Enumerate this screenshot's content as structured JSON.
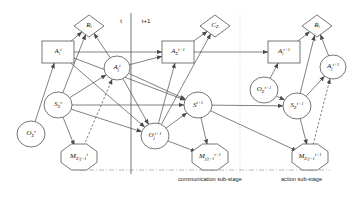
{
  "diagram": {
    "canvas": {
      "width": 363,
      "height": 198
    },
    "colors": {
      "stroke": "#4a4a4a",
      "node_fill": "#ffffff",
      "text": "#111111",
      "divider_solid": "#666666",
      "divider_dotted": "#bbbbbb",
      "bottom_dashdot": "#999999"
    },
    "time_markers": [
      {
        "name": "time-marker-t",
        "text": "t",
        "x": 121,
        "y": 21
      },
      {
        "name": "time-marker-t-plus-1",
        "text": "t+1",
        "x": 146,
        "y": 21
      }
    ],
    "stage_captions": [
      {
        "name": "communication-sub-stage-caption",
        "text": "communication sub-stage",
        "x": 178,
        "y": 176
      },
      {
        "name": "action-sub-stage-caption",
        "text": "action sub-stage",
        "x": 281,
        "y": 176
      }
    ],
    "nodes": [
      {
        "id": "R_i_left",
        "name": "decision-node-R-i-left",
        "shape": "diamond",
        "cx": 89,
        "cy": 26,
        "w": 30,
        "h": 22,
        "html": "R<sub>i</sub>"
      },
      {
        "id": "A_i_t",
        "name": "state-node-A-i-t",
        "shape": "rectangle",
        "cx": 58,
        "cy": 52,
        "w": 32,
        "h": 22,
        "html": "A<sub>i</sub><sup>t</sup>"
      },
      {
        "id": "A_j_t",
        "name": "state-node-A-j-t",
        "shape": "circle",
        "cx": 117,
        "cy": 68,
        "w": 26,
        "h": 24,
        "html": "A<sub>j</sub><sup>t</sup>"
      },
      {
        "id": "S_sigma_t",
        "name": "state-node-S-sigma-t",
        "shape": "circle",
        "cx": 58,
        "cy": 105,
        "w": 28,
        "h": 26,
        "html": "S<sub>&#931;</sub><sup>t</sup>"
      },
      {
        "id": "O_sigma_t",
        "name": "observation-node-O-sigma-t",
        "shape": "circle",
        "cx": 31,
        "cy": 134,
        "w": 28,
        "h": 26,
        "html": "O<sub>&#931;</sub><sup>t</sup>"
      },
      {
        "id": "M_sigma_t",
        "name": "message-node-M-sigma-j1-t",
        "shape": "hexagon",
        "cx": 79,
        "cy": 157,
        "w": 36,
        "h": 26,
        "html": "M<sub>&#931;/j&minus;1</sub><sup>t</sup>"
      },
      {
        "id": "C_sigma",
        "name": "utility-node-C-sigma",
        "shape": "diamond",
        "cx": 215,
        "cy": 26,
        "w": 30,
        "h": 22,
        "html": "C<sub>&#931;</sub>"
      },
      {
        "id": "A_sigma_t1",
        "name": "state-node-A-sigma-t-plus-1",
        "shape": "rectangle",
        "cx": 178,
        "cy": 52,
        "w": 32,
        "h": 22,
        "html": "A<sub>&#931;</sub><sup>t+1</sup>"
      },
      {
        "id": "S_t1",
        "name": "state-node-S-t-plus-1",
        "shape": "circle",
        "cx": 198,
        "cy": 105,
        "w": 28,
        "h": 26,
        "html": "S<sup>t+1</sup>"
      },
      {
        "id": "O_j_t1",
        "name": "observation-node-O-j-t-plus-1",
        "shape": "circle",
        "cx": 155,
        "cy": 136,
        "w": 28,
        "h": 26,
        "html": "O<sub>j</sub><sup>t+1</sup>"
      },
      {
        "id": "M_j_t1",
        "name": "message-node-M-j-j1-t-plus-1",
        "shape": "hexagon",
        "cx": 210,
        "cy": 157,
        "w": 36,
        "h": 26,
        "html": "M<sub>j/j&minus;1</sub><sup>t+1</sup>"
      },
      {
        "id": "O_sigma_t1",
        "name": "observation-node-O-sigma-t-plus-1",
        "shape": "circle",
        "cx": 264,
        "cy": 90,
        "w": 28,
        "h": 26,
        "html": "O<sub>&#931;</sub><sup>t+1</sup>"
      },
      {
        "id": "S_sigma_t1",
        "name": "state-node-S-sigma-t-plus-1",
        "shape": "circle",
        "cx": 297,
        "cy": 106,
        "w": 28,
        "h": 26,
        "html": "S<sub>&#931;</sub><sup>t+1</sup>"
      },
      {
        "id": "A_i_t1",
        "name": "state-node-A-i-t-plus-1",
        "shape": "rectangle",
        "cx": 284,
        "cy": 52,
        "w": 32,
        "h": 22,
        "html": "A<sub>i</sub><sup>t+1</sup>"
      },
      {
        "id": "R_i_right",
        "name": "decision-node-R-i-right",
        "shape": "diamond",
        "cx": 317,
        "cy": 26,
        "w": 30,
        "h": 22,
        "html": "R<sub>i</sub>"
      },
      {
        "id": "A_j_t1",
        "name": "state-node-A-j-t-plus-1",
        "shape": "circle",
        "cx": 333,
        "cy": 67,
        "w": 26,
        "h": 24,
        "html": "A<sub>j</sub><sup>t+1</sup>"
      },
      {
        "id": "M_sigma_t1",
        "name": "message-node-M-sigma-j1-t-plus-1",
        "shape": "hexagon",
        "cx": 310,
        "cy": 157,
        "w": 36,
        "h": 26,
        "html": "M<sub>&#931;/j&minus;1</sub><sup>t+1</sup>"
      }
    ],
    "edges": [
      {
        "name": "edge-A-i-t-to-R-i-left",
        "from": "A_i_t",
        "to": "R_i_left",
        "style": "solid"
      },
      {
        "name": "edge-A-j-t-to-R-i-left",
        "from": "A_j_t",
        "to": "R_i_left",
        "style": "solid"
      },
      {
        "name": "edge-A-i-t-to-A-sigma-t-plus-1",
        "from": "A_i_t",
        "to": "A_sigma_t1",
        "style": "solid"
      },
      {
        "name": "edge-A-i-t-to-S-t-plus-1",
        "from": "A_i_t",
        "to": "S_t1",
        "style": "solid"
      },
      {
        "name": "edge-A-i-t-to-O-j-t-plus-1",
        "from": "A_i_t",
        "to": "O_j_t1",
        "style": "solid"
      },
      {
        "name": "edge-A-j-t-to-A-sigma-t-plus-1",
        "from": "A_j_t",
        "to": "A_sigma_t1",
        "style": "solid"
      },
      {
        "name": "edge-A-j-t-to-S-t-plus-1",
        "from": "A_j_t",
        "to": "S_t1",
        "style": "solid"
      },
      {
        "name": "edge-A-j-t-to-O-j-t-plus-1",
        "from": "A_j_t",
        "to": "O_j_t1",
        "style": "solid"
      },
      {
        "name": "edge-S-sigma-t-to-A-j-t",
        "from": "S_sigma_t",
        "to": "A_j_t",
        "style": "solid"
      },
      {
        "name": "edge-S-sigma-t-to-R-i-left",
        "from": "S_sigma_t",
        "to": "R_i_left",
        "style": "solid"
      },
      {
        "name": "edge-S-sigma-t-to-S-t-plus-1",
        "from": "S_sigma_t",
        "to": "S_t1",
        "style": "solid"
      },
      {
        "name": "edge-S-sigma-t-to-O-j-t-plus-1",
        "from": "S_sigma_t",
        "to": "O_j_t1",
        "style": "solid"
      },
      {
        "name": "edge-S-sigma-t-to-M-sigma-t",
        "from": "S_sigma_t",
        "to": "M_sigma_t",
        "style": "solid"
      },
      {
        "name": "edge-O-sigma-t-to-A-i-t",
        "from": "O_sigma_t",
        "to": "A_i_t",
        "style": "solid"
      },
      {
        "name": "edge-M-sigma-t-to-A-j-t",
        "from": "M_sigma_t",
        "to": "A_j_t",
        "style": "dashed"
      },
      {
        "name": "edge-A-sigma-t-plus-1-to-C-sigma",
        "from": "A_sigma_t1",
        "to": "C_sigma",
        "style": "solid"
      },
      {
        "name": "edge-A-sigma-t-plus-1-to-A-i-t-plus-1",
        "from": "A_sigma_t1",
        "to": "A_i_t1",
        "style": "solid"
      },
      {
        "name": "edge-O-j-t-plus-1-to-C-sigma",
        "from": "O_j_t1",
        "to": "C_sigma",
        "style": "solid"
      },
      {
        "name": "edge-O-j-t-plus-1-to-A-sigma-t-plus-1",
        "from": "O_j_t1",
        "to": "A_sigma_t1",
        "style": "solid"
      },
      {
        "name": "edge-O-j-t-plus-1-to-S-t-plus-1",
        "from": "O_j_t1",
        "to": "S_t1",
        "style": "solid"
      },
      {
        "name": "edge-O-j-t-plus-1-to-M-j-t-plus-1",
        "from": "O_j_t1",
        "to": "M_j_t1",
        "style": "solid"
      },
      {
        "name": "edge-S-t-plus-1-to-S-sigma-t-plus-1",
        "from": "S_t1",
        "to": "S_sigma_t1",
        "style": "solid"
      },
      {
        "name": "edge-S-t-plus-1-to-M-j-t-plus-1",
        "from": "S_t1",
        "to": "M_j_t1",
        "style": "solid"
      },
      {
        "name": "edge-S-t-plus-1-to-M-sigma-t-plus-1",
        "from": "S_t1",
        "to": "M_sigma_t1",
        "style": "solid"
      },
      {
        "name": "edge-O-sigma-t-plus-1-to-S-sigma-t-plus-1",
        "from": "O_sigma_t1",
        "to": "S_sigma_t1",
        "style": "solid"
      },
      {
        "name": "edge-O-sigma-t-plus-1-to-A-i-t-plus-1",
        "from": "O_sigma_t1",
        "to": "A_i_t1",
        "style": "solid"
      },
      {
        "name": "edge-A-i-t-plus-1-to-R-i-right",
        "from": "A_i_t1",
        "to": "R_i_right",
        "style": "solid"
      },
      {
        "name": "edge-A-j-t-plus-1-to-R-i-right",
        "from": "A_j_t1",
        "to": "R_i_right",
        "style": "solid"
      },
      {
        "name": "edge-S-sigma-t-plus-1-to-A-j-t-plus-1",
        "from": "S_sigma_t1",
        "to": "A_j_t1",
        "style": "solid"
      },
      {
        "name": "edge-S-sigma-t-plus-1-to-R-i-right",
        "from": "S_sigma_t1",
        "to": "R_i_right",
        "style": "solid"
      },
      {
        "name": "edge-S-sigma-t-plus-1-to-M-sigma-t-plus-1",
        "from": "S_sigma_t1",
        "to": "M_sigma_t1",
        "style": "solid"
      },
      {
        "name": "edge-M-sigma-t-plus-1-to-A-j-t-plus-1",
        "from": "M_sigma_t1",
        "to": "A_j_t1",
        "style": "dashed"
      }
    ],
    "dividers": [
      {
        "name": "time-divider-line",
        "x1": 131,
        "y1": 13,
        "x2": 131,
        "y2": 174,
        "style": "solid"
      },
      {
        "name": "sub-stage-divider-line",
        "x1": 240,
        "y1": 13,
        "x2": 240,
        "y2": 174,
        "style": "dotted"
      },
      {
        "name": "message-flow-baseline",
        "x1": 79,
        "y1": 170,
        "x2": 330,
        "y2": 170,
        "style": "dashdot"
      }
    ]
  }
}
